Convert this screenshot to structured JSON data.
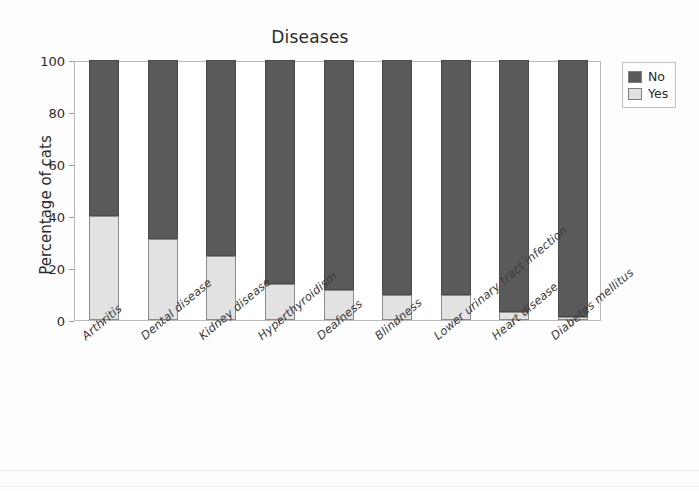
{
  "chart_data": {
    "type": "bar",
    "subtype": "stacked-percentage",
    "title": "Diseases",
    "xlabel": "",
    "ylabel": "Percentage of cats",
    "ylim": [
      0,
      100
    ],
    "yticks": [
      0,
      20,
      40,
      60,
      80,
      100
    ],
    "grid": false,
    "legend_position": "right",
    "categories": [
      "Arthritis",
      "Dental disease",
      "Kidney disease",
      "Hyperthyroidism",
      "Deafness",
      "Blindness",
      "Lower urinary tract infection",
      "Heart disease",
      "Diabetes mellitus"
    ],
    "series": [
      {
        "name": "Yes",
        "color": "#e2e2e2",
        "values": [
          40,
          31,
          24.5,
          14,
          11.5,
          9.5,
          9.5,
          3,
          1
        ]
      },
      {
        "name": "No",
        "color": "#5a5a5a",
        "values": [
          60,
          69,
          75.5,
          86,
          88.5,
          90.5,
          90.5,
          97,
          99
        ]
      }
    ],
    "stack_order": [
      "Yes",
      "No"
    ]
  },
  "legend": {
    "items": [
      {
        "label": "No",
        "color": "#5a5a5a"
      },
      {
        "label": "Yes",
        "color": "#e2e2e2"
      }
    ]
  }
}
